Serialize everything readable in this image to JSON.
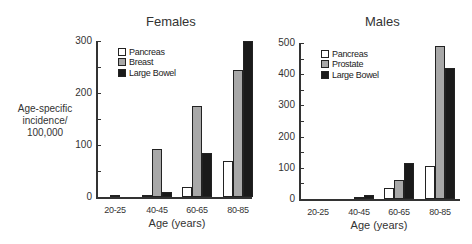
{
  "y_axis_label": [
    "Age-specific",
    "incidence/",
    "100,000"
  ],
  "colors": {
    "pancreas": "#ffffff",
    "breast": "#a8a8a8",
    "prostate": "#a8a8a8",
    "large_bowel": "#1a1a1a"
  },
  "chart_data": [
    {
      "type": "bar",
      "title": "Females",
      "xlabel": "Age (years)",
      "ylabel": "Age-specific incidence/ 100,000",
      "categories": [
        "20-25",
        "40-45",
        "60-65",
        "80-85"
      ],
      "series": [
        {
          "name": "Pancreas",
          "values": [
            0,
            3,
            20,
            70
          ]
        },
        {
          "name": "Breast",
          "values": [
            2,
            93,
            175,
            245
          ]
        },
        {
          "name": "Large Bowel",
          "values": [
            0,
            10,
            85,
            300
          ]
        }
      ],
      "yticks": [
        0,
        100,
        200,
        300
      ],
      "ylim": [
        0,
        300
      ],
      "grid": false,
      "legend_position": "upper left"
    },
    {
      "type": "bar",
      "title": "Males",
      "xlabel": "Age (years)",
      "ylabel": "",
      "categories": [
        "20-25",
        "40-45",
        "60-65",
        "80-85"
      ],
      "series": [
        {
          "name": "Pancreas",
          "values": [
            0,
            0,
            35,
            105
          ]
        },
        {
          "name": "Prostate",
          "values": [
            0,
            4,
            60,
            490
          ]
        },
        {
          "name": "Large Bowel",
          "values": [
            0,
            12,
            115,
            420
          ]
        }
      ],
      "yticks": [
        0,
        100,
        200,
        300,
        400,
        500
      ],
      "ylim": [
        0,
        500
      ],
      "grid": false,
      "legend_position": "upper left"
    }
  ]
}
